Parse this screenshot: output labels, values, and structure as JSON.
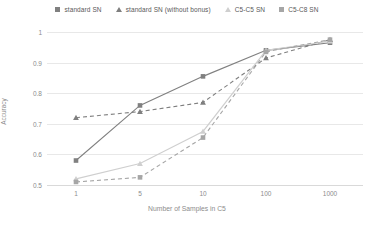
{
  "chart_data": {
    "type": "line",
    "title": "",
    "xlabel": "Number of Samples in C5",
    "ylabel": "Accuracy",
    "x": [
      1,
      5,
      10,
      100,
      1000
    ],
    "xtick_labels": [
      "1",
      "5",
      "10",
      "100",
      "1000"
    ],
    "xscale": "log",
    "ytick_labels": [
      "0.5",
      "0.6",
      "0.7",
      "0.8",
      "0.9",
      "1"
    ],
    "ylim": [
      0.5,
      1.0
    ],
    "ytick_values": [
      0.5,
      0.6,
      0.7,
      0.8,
      0.9,
      1.0
    ],
    "grid": "horizontal",
    "legend_position": "top",
    "series": [
      {
        "name": "standard SN",
        "values": [
          0.58,
          0.76,
          0.855,
          0.94,
          0.965
        ],
        "color": "#808080",
        "marker": "square",
        "dash": "solid"
      },
      {
        "name": "standard SN (without bonus)",
        "values": [
          0.72,
          0.74,
          0.77,
          0.915,
          0.975
        ],
        "color": "#7f7f7f",
        "marker": "triangle",
        "dash": "dashed"
      },
      {
        "name": "C5-C5 SN",
        "values": [
          0.52,
          0.57,
          0.675,
          0.94,
          0.97
        ],
        "color": "#cfcfcf",
        "marker": "triangle",
        "dash": "solid"
      },
      {
        "name": "C5-C8 SN",
        "values": [
          0.51,
          0.525,
          0.655,
          0.935,
          0.975
        ],
        "color": "#a6a6a6",
        "marker": "square",
        "dash": "dashed"
      }
    ]
  },
  "legend": {
    "items": [
      {
        "label": "standard SN",
        "marker": "square",
        "color": "#808080"
      },
      {
        "label": "standard SN (without bonus)",
        "marker": "triangle",
        "color": "#7f7f7f"
      },
      {
        "label": "C5-C5 SN",
        "marker": "triangle",
        "color": "#cfcfcf"
      },
      {
        "label": "C5-C8 SN",
        "marker": "square",
        "color": "#a6a6a6"
      }
    ]
  },
  "axes": {
    "y_label": "Accuracy",
    "x_label": "Number of Samples in C5",
    "y_ticks": [
      "1",
      "0.9",
      "0.8",
      "0.7",
      "0.6",
      "0.5"
    ],
    "x_ticks": [
      "1",
      "5",
      "10",
      "100",
      "1000"
    ]
  }
}
